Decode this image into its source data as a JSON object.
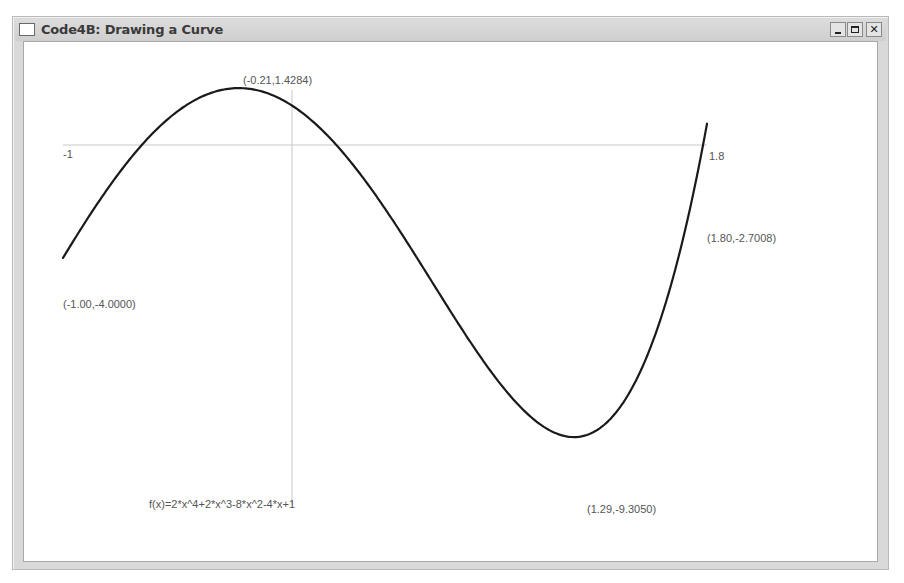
{
  "window": {
    "title": "Code4B: Drawing a Curve",
    "controls": {
      "minimize": "_",
      "maximize": "□",
      "close": "✕"
    }
  },
  "plot": {
    "function_label": "f(x)=2*x^4+2*x^3-8*x^2-4*x+1",
    "x_min_label": "-1",
    "x_max_label": "1.8",
    "point_labels": {
      "start": "(-1.00,-4.0000)",
      "local_max": "(-0.21,1.4284)",
      "local_min": "(1.29,-9.3050)",
      "end": "(1.80,-2.7008)"
    },
    "curve_color": "#1a1a1a",
    "axis_color": "#c8c8c8"
  },
  "chart_data": {
    "type": "line",
    "title": "Code4B: Drawing a Curve",
    "function": "f(x)=2*x^4+2*x^3-8*x^2-4*x+1",
    "xlabel": "",
    "ylabel": "",
    "xlim": [
      -1,
      1.8
    ],
    "ylim": [
      -9.305,
      1.4284
    ],
    "grid": false,
    "annotations": [
      {
        "x": -1.0,
        "y": -4.0,
        "text": "(-1.00,-4.0000)"
      },
      {
        "x": -0.21,
        "y": 1.4284,
        "text": "(-0.21,1.4284)"
      },
      {
        "x": 1.29,
        "y": -9.305,
        "text": "(1.29,-9.3050)"
      },
      {
        "x": 1.8,
        "y": -2.7008,
        "text": "(1.80,-2.7008)"
      }
    ],
    "tick_labels": {
      "x": [
        "-1",
        "1.8"
      ]
    },
    "series": [
      {
        "name": "f(x)",
        "x": [
          -1.0,
          -0.8,
          -0.6,
          -0.4,
          -0.21,
          0.0,
          0.2,
          0.4,
          0.6,
          0.8,
          1.0,
          1.2,
          1.29,
          1.4,
          1.6,
          1.8
        ],
        "y": [
          -4.0,
          -0.9248,
          0.7312,
          1.3312,
          1.4284,
          1.0,
          -0.2672,
          -2.2768,
          -4.7648,
          -7.2768,
          -9.0,
          -9.2048,
          -9.305,
          -8.3648,
          -6.3328,
          -2.7008
        ]
      }
    ]
  }
}
